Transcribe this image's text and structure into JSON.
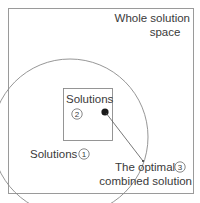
{
  "diagram": {
    "outer_label_line1": "Whole solution",
    "outer_label_line2": "space",
    "circle_label": "Solutions",
    "circle_number": "1",
    "square_label": "Solutions",
    "square_number": "2",
    "point_label_line1": "The optimal",
    "point_label_line2": "combined solution",
    "point_number": "3",
    "colors": {
      "stroke": "#8a8a8a",
      "text": "#3a3a3a",
      "point": "#1a1a1a"
    }
  }
}
